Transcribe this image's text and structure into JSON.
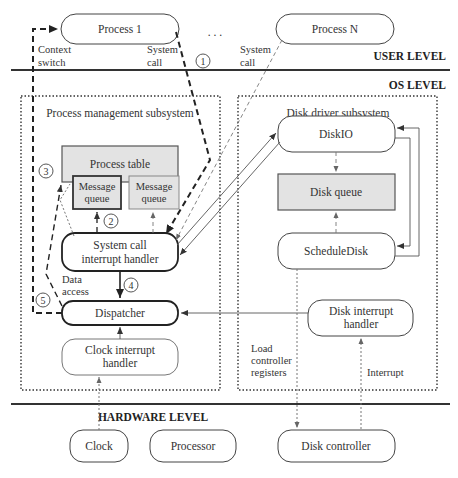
{
  "levels": {
    "user": "USER LEVEL",
    "os": "OS LEVEL",
    "hardware": "HARDWARE LEVEL"
  },
  "user_processes": {
    "process_1": "Process 1",
    "ellipsis": ". . .",
    "process_n": "Process N"
  },
  "annotations": {
    "context_switch_1": "Context",
    "context_switch_2": "switch",
    "system_call_1a": "System",
    "system_call_1b": "call",
    "system_call_na": "System",
    "system_call_nb": "call",
    "data_access_1": "Data",
    "data_access_2": "access",
    "load_ctrl_1": "Load",
    "load_ctrl_2": "controller",
    "load_ctrl_3": "registers",
    "interrupt": "Interrupt"
  },
  "step_markers": [
    "1",
    "2",
    "3",
    "4",
    "5"
  ],
  "process_management": {
    "title": "Process management subsystem",
    "process_table": "Process table",
    "message_queue_1a": "Message",
    "message_queue_1b": "queue",
    "message_queue_2a": "Message",
    "message_queue_2b": "queue",
    "syscall_handler_1": "System call",
    "syscall_handler_2": "interrupt handler",
    "dispatcher": "Dispatcher",
    "clock_handler_1": "Clock interrupt",
    "clock_handler_2": "handler"
  },
  "disk_driver": {
    "title": "Disk driver subsystem",
    "diskio": "DiskIO",
    "disk_queue": "Disk queue",
    "schedule_disk": "ScheduleDisk",
    "disk_interrupt_1": "Disk interrupt",
    "disk_interrupt_2": "handler"
  },
  "hardware": {
    "clock": "Clock",
    "processor": "Processor",
    "disk_controller": "Disk controller"
  }
}
